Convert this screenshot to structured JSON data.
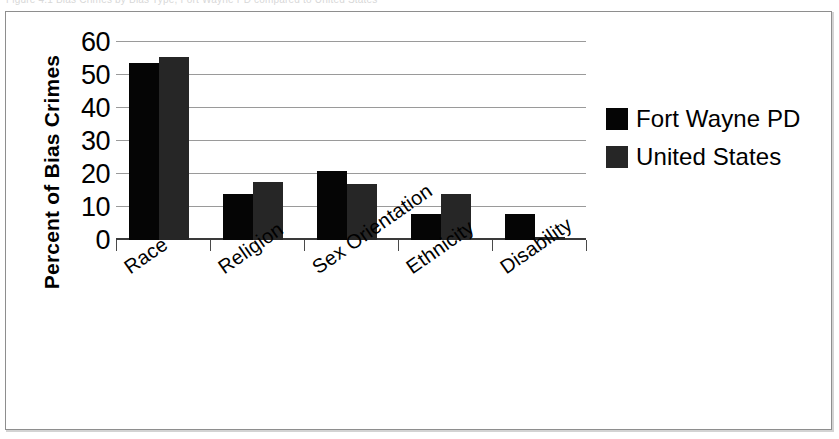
{
  "figure": {
    "caption_fragment": "Figure 4.1 Bias Crimes by Bias Type, Fort Wayne PD compared to United States",
    "border_color": "#8e8e8e",
    "background": "#ffffff"
  },
  "chart_data": {
    "type": "bar",
    "title": "",
    "xlabel": "",
    "ylabel": "Percent of Bias Crimes",
    "categories": [
      "Race",
      "Religion",
      "Sex Orientation",
      "Ethnicity",
      "Disability"
    ],
    "series": [
      {
        "name": "Fort Wayne PD",
        "color": "#050505",
        "values": [
          53.5,
          14.0,
          21.0,
          8.0,
          8.0
        ]
      },
      {
        "name": "United States",
        "color": "#262626",
        "values": [
          55.5,
          17.5,
          17.0,
          14.0,
          1.0
        ]
      }
    ],
    "ylim": [
      0,
      60
    ],
    "yticks": [
      60,
      50,
      40,
      30,
      20,
      10,
      0
    ],
    "ytick_labels": [
      "60",
      "50",
      "40",
      "30",
      "20",
      "10",
      "0"
    ],
    "grid": true,
    "grid_axis": "y",
    "legend_position": "right",
    "bar_orientation": "vertical",
    "xtick_label_rotation": -35
  },
  "legend": {
    "entries": [
      {
        "label": "Fort Wayne PD",
        "color": "#050505"
      },
      {
        "label": "United States",
        "color": "#262626"
      }
    ]
  }
}
